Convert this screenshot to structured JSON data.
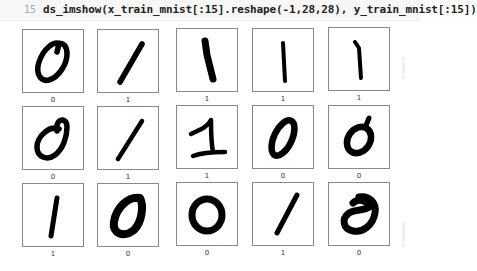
{
  "code_cell": {
    "line_number": "15",
    "code": "ds_imshow(x_train_mnist[:15].reshape(-1,28,28), y_train_mnist[:15])"
  },
  "output": {
    "grid": {
      "rows": 3,
      "cols": 5
    },
    "images": [
      {
        "label": "0",
        "digit_shape": "zero-slanted-open-top"
      },
      {
        "label": "1",
        "digit_shape": "one-diagonal"
      },
      {
        "label": "1",
        "digit_shape": "one-thick-leaning"
      },
      {
        "label": "1",
        "digit_shape": "one-thin-vertical"
      },
      {
        "label": "1",
        "digit_shape": "one-thin-vertical"
      },
      {
        "label": "0",
        "digit_shape": "zero-with-loop-top"
      },
      {
        "label": "1",
        "digit_shape": "one-diagonal"
      },
      {
        "label": "1",
        "digit_shape": "one-with-flag-and-base"
      },
      {
        "label": "0",
        "digit_shape": "zero-narrow-slanted"
      },
      {
        "label": "0",
        "digit_shape": "zero-slanted-tail"
      },
      {
        "label": "1",
        "digit_shape": "one-vertical"
      },
      {
        "label": "0",
        "digit_shape": "zero-thick-round"
      },
      {
        "label": "0",
        "digit_shape": "zero-round"
      },
      {
        "label": "1",
        "digit_shape": "one-diagonal"
      },
      {
        "label": "0",
        "digit_shape": "zero-filled-blob"
      }
    ]
  },
  "colors": {
    "code_background": "#f7f7f7",
    "line_number": "#a8a8a8",
    "code_text": "#222222",
    "frame_border": "#8a8a8a",
    "digit_ink": "#000000"
  }
}
